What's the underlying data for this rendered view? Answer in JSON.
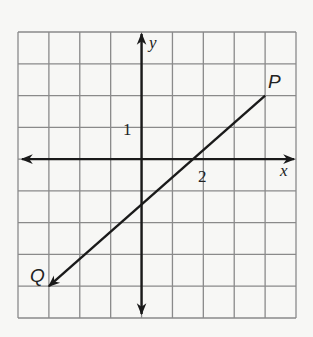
{
  "diagram": {
    "type": "coordinate-plane",
    "grid": {
      "x_min": -4,
      "x_max": 5,
      "y_min": -5,
      "y_max": 4
    },
    "axes": {
      "x_label": "x",
      "y_label": "y"
    },
    "tick_labels": {
      "x_tick": "2",
      "y_tick": "1"
    },
    "line": {
      "points": [
        {
          "label": "P",
          "x": 4,
          "y": 2
        },
        {
          "label": "Q",
          "x": -3,
          "y": -4
        }
      ],
      "arrow_at": "Q"
    },
    "colors": {
      "grid": "#8a8a8a",
      "axis": "#1a1a1a",
      "background": "#f7f7f5"
    }
  }
}
